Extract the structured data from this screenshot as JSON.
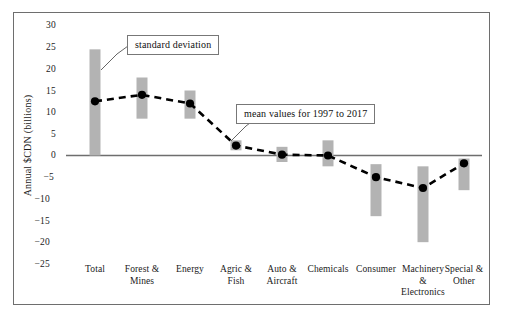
{
  "chart_data": {
    "type": "bar",
    "title": "",
    "subtitle": "",
    "xlabel": "",
    "ylabel": "Annual $CDN (billions)",
    "ylim": [
      -25,
      30
    ],
    "yticks": [
      30,
      25,
      20,
      15,
      10,
      5,
      0,
      -5,
      -10,
      -15,
      -20,
      -25
    ],
    "ytick_labels": [
      "30",
      "25",
      "20",
      "15",
      "10",
      "5",
      "0",
      "−5",
      "−10",
      "−15",
      "−20",
      "−25"
    ],
    "grid": false,
    "legend": "none",
    "categories": [
      "Total",
      "Forest & Mines",
      "Energy",
      "Agric & Fish",
      "Auto & Aircraft",
      "Chemicals",
      "Consumer",
      "Machinery & Electronics",
      "Special & Other"
    ],
    "category_lines": [
      [
        "Total"
      ],
      [
        "Forest &",
        "Mines"
      ],
      [
        "Energy"
      ],
      [
        "Agric &",
        "Fish"
      ],
      [
        "Auto &",
        "Aircraft"
      ],
      [
        "Chemicals"
      ],
      [
        "Consumer"
      ],
      [
        "Machinery",
        "&",
        "Electronics"
      ],
      [
        "Special &",
        "Other"
      ]
    ],
    "series": [
      {
        "name": "mean values for 1997 to 2017",
        "kind": "line-markers",
        "values": [
          12.5,
          14.0,
          12.0,
          2.3,
          0.2,
          0.0,
          -5.0,
          -7.5,
          -1.8
        ]
      },
      {
        "name": "standard deviation",
        "kind": "range-bar",
        "lower": [
          0.0,
          8.5,
          8.5,
          1.2,
          -1.5,
          -2.5,
          -14.0,
          -20.0,
          -8.0
        ],
        "upper": [
          24.5,
          18.0,
          15.0,
          3.5,
          2.0,
          3.5,
          -2.0,
          -2.5,
          -0.7
        ]
      }
    ],
    "annotations": [
      {
        "id": "std-dev",
        "text": "standard deviation",
        "points_to": "Total"
      },
      {
        "id": "mean-values",
        "text": "mean values for 1997 to 2017",
        "points_to": "Agric & Fish"
      }
    ],
    "colors": {
      "bar": "#b3b3b3",
      "marker": "#000000",
      "line": "#000000",
      "axis": "#6e6e6e",
      "frame": "#6e6e6e",
      "callout_border": "#777777",
      "text": "#1a1a1a"
    }
  }
}
